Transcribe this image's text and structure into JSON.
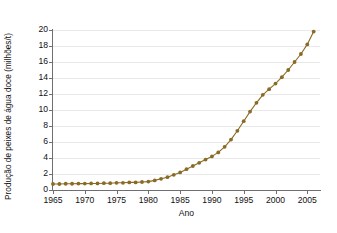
{
  "chart_data": {
    "type": "line",
    "title": "",
    "subtitle": "",
    "xlabel": "Ano",
    "ylabel": "Produção de peixes de água doce (milhões/t)",
    "xlim": [
      1965,
      2007
    ],
    "ylim": [
      0,
      20
    ],
    "xticks": [
      1965,
      1970,
      1975,
      1980,
      1985,
      1990,
      1995,
      2000,
      2005
    ],
    "yticks": [
      0,
      2,
      4,
      6,
      8,
      10,
      12,
      14,
      16,
      18,
      20
    ],
    "grid": "horizontal",
    "legend": "none",
    "marker": "circle",
    "line_color": "#8a6a24",
    "marker_color": "#8a6a24",
    "grid_color": "#e9e9ea",
    "axis_color": "#6f6f72",
    "background_color": "#ffffff",
    "series": [
      {
        "name": "Produção de peixes de água doce",
        "x": [
          1965,
          1966,
          1967,
          1968,
          1969,
          1970,
          1971,
          1972,
          1973,
          1974,
          1975,
          1976,
          1977,
          1978,
          1979,
          1980,
          1981,
          1982,
          1983,
          1984,
          1985,
          1986,
          1987,
          1988,
          1989,
          1990,
          1991,
          1992,
          1993,
          1994,
          1995,
          1996,
          1997,
          1998,
          1999,
          2000,
          2001,
          2002,
          2003,
          2004,
          2005,
          2006
        ],
        "values": [
          0.75,
          0.75,
          0.78,
          0.78,
          0.8,
          0.8,
          0.82,
          0.82,
          0.85,
          0.85,
          0.9,
          0.9,
          0.95,
          0.95,
          1.0,
          1.05,
          1.2,
          1.4,
          1.6,
          1.9,
          2.2,
          2.6,
          3.0,
          3.4,
          3.8,
          4.2,
          4.7,
          5.4,
          6.3,
          7.4,
          8.6,
          9.8,
          10.9,
          11.9,
          12.6,
          13.3,
          14.1,
          15.0,
          16.0,
          17.0,
          18.2,
          19.8
        ]
      }
    ]
  }
}
